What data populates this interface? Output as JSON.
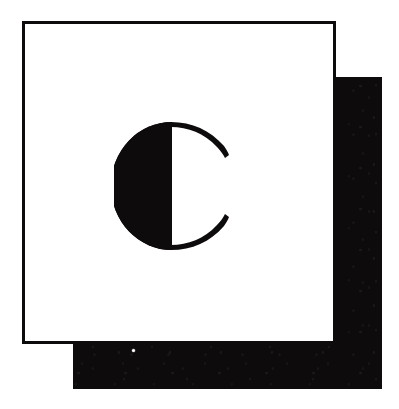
{
  "artwork": {
    "kind": "logo-emblem",
    "title": "Letter C emblem",
    "description": "A bold serif capital letter C centered in an outlined white square, backed by an offset solid black square forming a hard drop shadow.",
    "background_color": "#ffffff"
  },
  "frame": {
    "name": "outlined white square",
    "fill_color": "#ffffff",
    "border_color": "#0d0b0b",
    "border_width_px": 3,
    "left": 22,
    "top": 21,
    "width": 314,
    "height": 323
  },
  "shadow": {
    "name": "offset black square",
    "fill_color": "#0d0b0b",
    "left": 73,
    "top": 77,
    "width": 309,
    "height": 312,
    "offset_x": 51,
    "offset_y": 56,
    "texture": "scanned-noise"
  },
  "speck": {
    "name": "white scan artifact",
    "color": "#ffffff",
    "left": 132,
    "top": 349,
    "size_px": 3
  },
  "glyph": {
    "character": "C",
    "color": "#0d0b0b",
    "style": "bold serif, solid left bowl with flat vertical inner edge and tapering hairline terminals",
    "center_x": 175,
    "center_y": 186,
    "radius": 59,
    "bounds": {
      "left": 117,
      "top": 122,
      "right": 233,
      "bottom": 250
    }
  }
}
